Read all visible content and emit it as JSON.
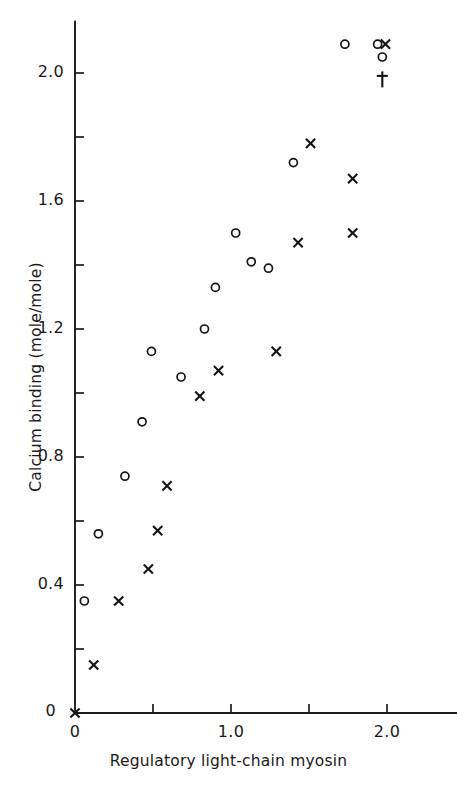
{
  "chart_data": {
    "type": "scatter",
    "title": "",
    "xlabel": "Regulatory light-chain myosin",
    "ylabel": "Calcium binding (mole/mole)",
    "xlim": [
      0.0,
      2.45
    ],
    "ylim": [
      0.0,
      2.16
    ],
    "grid": false,
    "legend": "none",
    "x_ticks": [
      0.0,
      0.5,
      1.0,
      1.5,
      2.0
    ],
    "x_tick_labels": [
      "0",
      "",
      "1.0",
      "",
      "2.0"
    ],
    "y_ticks": [
      0.0,
      0.2,
      0.4,
      0.6,
      0.8,
      1.0,
      1.2,
      1.4,
      1.6,
      1.8,
      2.0
    ],
    "y_tick_labels": [
      "0",
      "",
      "0.4",
      "",
      "0.8",
      "",
      "1.2",
      "",
      "1.6",
      "",
      "2.0"
    ],
    "series": [
      {
        "name": "open-circle",
        "marker": "circle",
        "points": [
          [
            0.06,
            0.35
          ],
          [
            0.15,
            0.56
          ],
          [
            0.32,
            0.74
          ],
          [
            0.43,
            0.91
          ],
          [
            0.49,
            1.13
          ],
          [
            0.68,
            1.05
          ],
          [
            0.83,
            1.2
          ],
          [
            0.9,
            1.33
          ],
          [
            1.03,
            1.5
          ],
          [
            1.13,
            1.41
          ],
          [
            1.24,
            1.39
          ],
          [
            1.4,
            1.72
          ],
          [
            1.73,
            2.09
          ],
          [
            1.94,
            2.09
          ],
          [
            1.97,
            2.05
          ]
        ]
      },
      {
        "name": "cross",
        "marker": "x",
        "points": [
          [
            0.0,
            0.0
          ],
          [
            0.12,
            0.15
          ],
          [
            0.28,
            0.35
          ],
          [
            0.47,
            0.45
          ],
          [
            0.53,
            0.57
          ],
          [
            0.59,
            0.71
          ],
          [
            0.8,
            0.99
          ],
          [
            0.92,
            1.07
          ],
          [
            1.29,
            1.13
          ],
          [
            1.43,
            1.47
          ],
          [
            1.51,
            1.78
          ],
          [
            1.78,
            1.67
          ],
          [
            1.78,
            1.5
          ],
          [
            1.99,
            2.09
          ]
        ]
      },
      {
        "name": "dagger",
        "marker": "dagger",
        "points": [
          [
            1.97,
            1.98
          ]
        ]
      }
    ]
  }
}
